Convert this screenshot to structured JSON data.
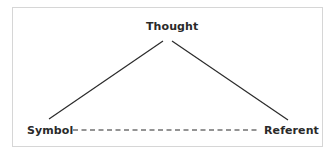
{
  "diagram": {
    "nodes": {
      "top": "Thought",
      "left": "Symbol",
      "right": "Referent"
    },
    "edges": [
      {
        "from": "Thought",
        "to": "Symbol",
        "style": "solid"
      },
      {
        "from": "Thought",
        "to": "Referent",
        "style": "solid"
      },
      {
        "from": "Symbol",
        "to": "Referent",
        "style": "dashed"
      }
    ],
    "colors": {
      "line": "#2a2a2a",
      "border": "#d6d6d6",
      "background": "#ffffff"
    }
  }
}
